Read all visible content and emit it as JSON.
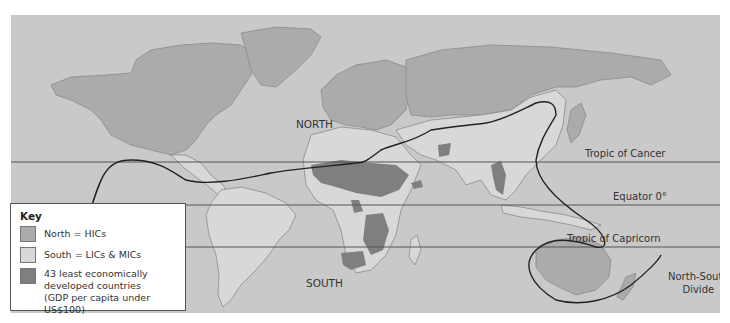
{
  "map": {
    "region_labels": {
      "north": "NORTH",
      "south": "SOUTH"
    },
    "latitude_lines": [
      {
        "label": "Tropic of Cancer"
      },
      {
        "label": "Equator 0°"
      },
      {
        "label": "Tropic of Capricorn"
      }
    ],
    "divide_label_line1": "North-South",
    "divide_label_line2": "Divide",
    "colors": {
      "ocean": "#c9c9c9",
      "north": "#ababab",
      "south": "#d8d8d8",
      "least_developed": "#7f7f7f",
      "coastline": "#8a8a8a",
      "divide_line": "#222222",
      "latitude_line": "#555555"
    }
  },
  "legend": {
    "title": "Key",
    "items": [
      {
        "label": "North = HICs",
        "color": "#ababab"
      },
      {
        "label": "South = LICs & MICs",
        "color": "#d8d8d8"
      },
      {
        "label_line1": "43 least economically",
        "label_line2": "developed countries",
        "label_line3": "(GDP per capita under US$100)",
        "color": "#7f7f7f"
      }
    ]
  }
}
